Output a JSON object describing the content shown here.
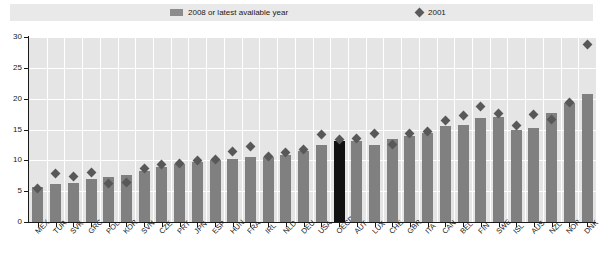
{
  "legend": {
    "items": [
      {
        "label": "2008 or latest available year",
        "icon": "bar-swatch-icon",
        "color": "#8c8c8c"
      },
      {
        "label": "2001",
        "icon": "diamond-marker-icon",
        "color": "#5a5a5a"
      }
    ]
  },
  "colors": {
    "bar": "#808080",
    "bar_highlight": "#111111",
    "marker": "#585858",
    "plot_background": "#e5e5e5",
    "gridline": "#ffffff",
    "axis": "#1a1a1a",
    "legend_background": "#e9e9e9"
  },
  "chart_data": {
    "type": "bar",
    "title": "",
    "subtitle": "",
    "xlabel": "",
    "ylabel": "",
    "ylim": [
      0,
      30
    ],
    "yticks": [
      0,
      5,
      10,
      15,
      20,
      25,
      30
    ],
    "ytick_labels": [
      "0",
      "5",
      "10",
      "15",
      "20",
      "25",
      "30"
    ],
    "grid": true,
    "legend_position": "top",
    "highlight_category": "OECD",
    "categories": [
      "MEX",
      "TUR",
      "SVK",
      "GRC",
      "POL",
      "KOR",
      "SVN",
      "CZE",
      "PRT",
      "JPN",
      "ESP",
      "HUN",
      "FRA",
      "IRL",
      "NLD",
      "DEU",
      "USA",
      "OECD",
      "AUT",
      "LUX",
      "CHE",
      "GBR",
      "ITA",
      "CAN",
      "BEL",
      "FIN",
      "SWE",
      "ISL",
      "AUS",
      "NZL",
      "NOR",
      "DNK"
    ],
    "series": [
      {
        "name": "2008 or latest available year",
        "type": "bar",
        "color": "#808080",
        "values": [
          5.6,
          6.2,
          6.4,
          7.0,
          7.3,
          7.6,
          8.3,
          9.0,
          9.4,
          9.8,
          10.0,
          10.2,
          10.5,
          10.6,
          10.9,
          11.5,
          12.5,
          13.2,
          13.1,
          12.5,
          13.4,
          14.0,
          14.4,
          15.5,
          15.8,
          16.8,
          17.0,
          14.9,
          15.3,
          17.6,
          19.3,
          20.8
        ]
      },
      {
        "name": "2001",
        "type": "scatter",
        "marker": "diamond",
        "color": "#585858",
        "values": [
          5.5,
          7.8,
          7.3,
          8.0,
          6.3,
          6.4,
          8.7,
          9.3,
          9.5,
          9.9,
          10.2,
          11.4,
          12.2,
          10.6,
          11.2,
          11.7,
          14.2,
          13.3,
          13.5,
          14.3,
          12.6,
          14.3,
          14.6,
          16.5,
          17.3,
          18.8,
          17.6,
          15.7,
          17.4,
          16.7,
          19.3,
          28.8
        ]
      }
    ]
  }
}
